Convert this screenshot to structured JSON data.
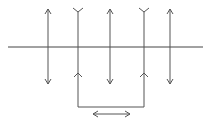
{
  "diagram": {
    "width": 212,
    "height": 124,
    "stroke_color": "#555555",
    "baseline_color": "#444444",
    "baseline": {
      "x1": 8,
      "x2": 203,
      "y": 47
    },
    "double_arrows": [
      {
        "x": 48,
        "y1": 9,
        "y2": 84
      },
      {
        "x": 110,
        "y1": 9,
        "y2": 84
      },
      {
        "x": 170,
        "y1": 9,
        "y2": 84
      }
    ],
    "forked_lines": [
      {
        "x": 78,
        "y_top": 8,
        "y_chevron": 73,
        "y_bottom": 107
      },
      {
        "x": 144,
        "y_top": 8,
        "y_chevron": 73,
        "y_bottom": 107
      }
    ],
    "bottom_connector": {
      "x1": 78,
      "x2": 144,
      "y": 107
    },
    "horizontal_double_arrow": {
      "x1": 93,
      "x2": 130,
      "y": 114
    }
  }
}
